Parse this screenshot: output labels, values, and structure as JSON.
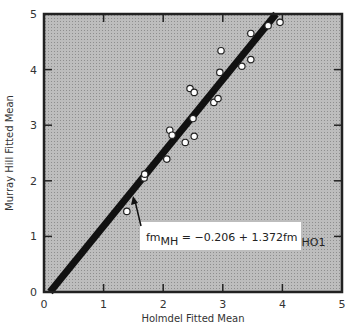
{
  "chart_data": {
    "type": "scatter",
    "title": "",
    "xlabel": "Holmdel Fitted Mean",
    "ylabel": "Murray Hill Fitted Mean",
    "xlim": [
      0,
      5
    ],
    "ylim": [
      0,
      5
    ],
    "xticks": [
      "0",
      "1",
      "2",
      "3",
      "4",
      "5"
    ],
    "yticks": [
      "0",
      "1",
      "2",
      "3",
      "4",
      "5"
    ],
    "grid": false,
    "background": "#b8b8b8",
    "series": [
      {
        "name": "observations",
        "marker": "open-circle",
        "points": [
          [
            1.39,
            1.45
          ],
          [
            1.68,
            2.05
          ],
          [
            1.69,
            2.12
          ],
          [
            2.06,
            2.39
          ],
          [
            2.11,
            2.91
          ],
          [
            2.15,
            2.82
          ],
          [
            2.37,
            2.69
          ],
          [
            2.5,
            3.12
          ],
          [
            2.52,
            2.8
          ],
          [
            2.45,
            3.66
          ],
          [
            2.52,
            3.59
          ],
          [
            2.85,
            3.41
          ],
          [
            2.92,
            3.48
          ],
          [
            2.95,
            3.95
          ],
          [
            2.97,
            4.34
          ],
          [
            3.32,
            4.06
          ],
          [
            3.47,
            4.18
          ],
          [
            3.47,
            4.65
          ],
          [
            3.76,
            4.79
          ],
          [
            3.96,
            4.85
          ]
        ]
      }
    ],
    "fit_line": {
      "intercept": -0.206,
      "slope": 1.372,
      "x_range_px": [
        50,
        276
      ]
    },
    "annotation": {
      "lhs": "fm",
      "lhs_sub": "MH",
      "rhs": " = −0.206 + 1.372fm",
      "rhs_sub": "HO1",
      "arrow": true
    }
  }
}
